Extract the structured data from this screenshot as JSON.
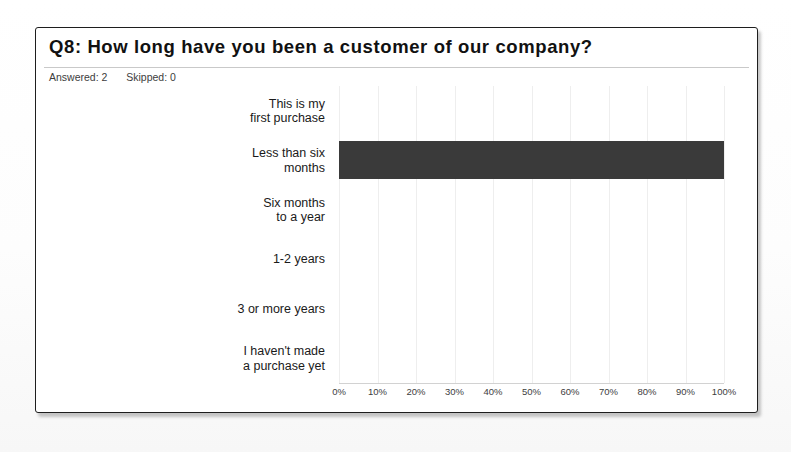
{
  "card": {
    "title": "Q8:  How long have you been a customer of our company?",
    "answered_label": "Answered: 2",
    "skipped_label": "Skipped: 0"
  },
  "chart_data": {
    "type": "bar",
    "orientation": "horizontal",
    "title": "Q8:  How long have you been a customer of our company?",
    "xlabel": "",
    "ylabel": "",
    "xlim": [
      0,
      100
    ],
    "xtick_labels": [
      "0%",
      "10%",
      "20%",
      "30%",
      "40%",
      "50%",
      "60%",
      "70%",
      "80%",
      "90%",
      "100%"
    ],
    "xtick_values": [
      0,
      10,
      20,
      30,
      40,
      50,
      60,
      70,
      80,
      90,
      100
    ],
    "grid": true,
    "legend": false,
    "categories": [
      "This is my\nfirst purchase",
      "Less than six\nmonths",
      "Six months\nto a year",
      "1-2 years",
      "3 or more years",
      "I haven't made\na purchase yet"
    ],
    "category_lines": [
      [
        "This is my",
        "first purchase"
      ],
      [
        "Less than six",
        "months"
      ],
      [
        "Six months",
        "to a year"
      ],
      [
        "1-2 years"
      ],
      [
        "3 or more years"
      ],
      [
        "I haven't made",
        "a purchase yet"
      ]
    ],
    "values": [
      0,
      100,
      0,
      0,
      0,
      0
    ],
    "bar_color": "#3a3a3a",
    "answered": 2,
    "skipped": 0
  },
  "colors": {
    "bar": "#3a3a3a",
    "border": "#1e1e1e",
    "grid": "#eeeeee",
    "text": "#1a1a1a"
  }
}
